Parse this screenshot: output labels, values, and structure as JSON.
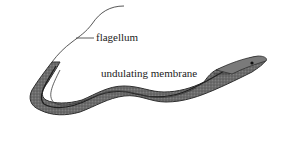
{
  "diagram": {
    "labels": [
      {
        "id": "flagellum",
        "text": "flagellum"
      },
      {
        "id": "undulating_membrane",
        "text": "undulating membrane"
      }
    ],
    "colors": {
      "body_fill": "#6e6e6e",
      "body_dark": "#2f2f2f",
      "body_light": "#9a9a9a",
      "line": "#333333",
      "text": "#222222"
    }
  }
}
